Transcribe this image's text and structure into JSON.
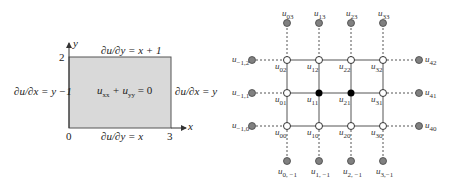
{
  "left_figure": {
    "axis_x_label": "x",
    "axis_y_label": "y",
    "tick_x0": "0",
    "tick_x3": "3",
    "tick_y2": "2",
    "top_bc": "∂u/∂y = x + 1",
    "bottom_bc": "∂u/∂y = x",
    "left_bc": "∂u/∂x = y −1",
    "right_bc": "∂u/∂x = y",
    "pde": "u",
    "pde_sub1": "xx",
    "pde_plus": " + u",
    "pde_sub2": "yy",
    "pde_rhs": " = 0",
    "region_fill": "#d9d9d9",
    "region_stroke": "#555555"
  },
  "right_figure": {
    "colors": {
      "grid_line": "#555555",
      "ghost_node": "#808080",
      "interior_node": "#000000",
      "boundary_node": "#ffffff"
    },
    "top_ghost": [
      {
        "base": "u",
        "sub": "03"
      },
      {
        "base": "u",
        "sub": "13"
      },
      {
        "base": "u",
        "sub": "23"
      },
      {
        "base": "u",
        "sub": "33"
      }
    ],
    "bottom_ghost": [
      {
        "base": "u",
        "sub": "0, −1"
      },
      {
        "base": "u",
        "sub": "1, −1"
      },
      {
        "base": "u",
        "sub": "2, −1"
      },
      {
        "base": "u",
        "sub": "3,−1"
      }
    ],
    "left_ghost": [
      {
        "base": "u",
        "sub": "−1,2"
      },
      {
        "base": "u",
        "sub": "−1,1"
      },
      {
        "base": "u",
        "sub": "−1,0"
      }
    ],
    "right_ghost": [
      {
        "base": "u",
        "sub": "42"
      },
      {
        "base": "u",
        "sub": "41"
      },
      {
        "base": "u",
        "sub": "40"
      }
    ],
    "grid_row2": [
      {
        "base": "u",
        "sub": "02"
      },
      {
        "base": "u",
        "sub": "12"
      },
      {
        "base": "u",
        "sub": "22"
      },
      {
        "base": "u",
        "sub": "32"
      }
    ],
    "grid_row1": [
      {
        "base": "u",
        "sub": "01"
      },
      {
        "base": "u",
        "sub": "11"
      },
      {
        "base": "u",
        "sub": "21"
      },
      {
        "base": "u",
        "sub": "31"
      }
    ],
    "grid_row0": [
      {
        "base": "u",
        "sub": "00"
      },
      {
        "base": "u",
        "sub": "10"
      },
      {
        "base": "u",
        "sub": "20"
      },
      {
        "base": "u",
        "sub": "30"
      }
    ]
  }
}
